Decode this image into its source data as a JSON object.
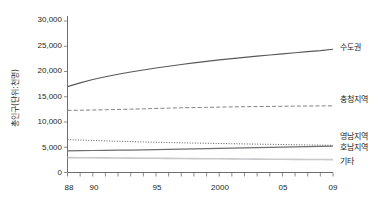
{
  "chart_data": {
    "type": "line",
    "title": "",
    "xlabel": "",
    "ylabel": "총인구(단위:천명)",
    "ylim": [
      0,
      30000
    ],
    "xlim": [
      1988,
      2009
    ],
    "grid": false,
    "legend_position": "right-inline",
    "y_ticks": [
      "0",
      "5,000",
      "10,000",
      "15,000",
      "20,000",
      "25,000",
      "30,000"
    ],
    "y_tick_values": [
      0,
      5000,
      10000,
      15000,
      20000,
      25000,
      30000
    ],
    "x_ticks": [
      "88",
      "90",
      "95",
      "2000",
      "05",
      "09"
    ],
    "x_tick_values": [
      1988,
      1990,
      1995,
      2000,
      2005,
      2009
    ],
    "x": [
      1988,
      1989,
      1990,
      1991,
      1992,
      1993,
      1994,
      1995,
      1996,
      1997,
      1998,
      1999,
      2000,
      2001,
      2002,
      2003,
      2004,
      2005,
      2006,
      2007,
      2008,
      2009
    ],
    "series": [
      {
        "name": "수도권",
        "style": "solid",
        "color": "#58595b",
        "values": [
          17000,
          17750,
          18400,
          18950,
          19450,
          19900,
          20300,
          20700,
          21050,
          21400,
          21700,
          22000,
          22300,
          22550,
          22800,
          23050,
          23280,
          23500,
          23720,
          23930,
          24130,
          24400
        ]
      },
      {
        "name": "충청지역",
        "style": "dashed",
        "color": "#808285",
        "values": [
          12300,
          12330,
          12370,
          12420,
          12480,
          12540,
          12600,
          12680,
          12750,
          12810,
          12860,
          12900,
          12950,
          12990,
          13030,
          13060,
          13090,
          13120,
          13140,
          13160,
          13180,
          13200
        ]
      },
      {
        "name": "영남지역",
        "style": "dotted",
        "color": "#58595b",
        "values": [
          6500,
          6420,
          6340,
          6260,
          6190,
          6120,
          6050,
          5990,
          5930,
          5880,
          5830,
          5790,
          5740,
          5700,
          5660,
          5620,
          5580,
          5540,
          5500,
          5460,
          5420,
          5380
        ]
      },
      {
        "name": "호남지역",
        "style": "solid",
        "color": "#6d6e70",
        "values": [
          4300,
          4330,
          4360,
          4390,
          4420,
          4450,
          4490,
          4530,
          4570,
          4610,
          4660,
          4710,
          4760,
          4810,
          4860,
          4910,
          4960,
          5010,
          5060,
          5110,
          5160,
          5220
        ]
      },
      {
        "name": "기타",
        "style": "solid",
        "color": "#c7c8ca",
        "values": [
          2950,
          2930,
          2910,
          2890,
          2870,
          2850,
          2830,
          2810,
          2790,
          2770,
          2750,
          2730,
          2710,
          2690,
          2670,
          2650,
          2630,
          2610,
          2600,
          2580,
          2560,
          2550
        ]
      }
    ]
  },
  "axis": {
    "y_title": "총인구(단위:천명)"
  },
  "labels": {
    "sudogwon": "수도권",
    "chungcheong": "충청지역",
    "yeongnam": "영남지역",
    "honam": "호남지역",
    "gita": "기타"
  },
  "y_axis_ticks": {
    "t0": "0",
    "t1": "5,000",
    "t2": "10,000",
    "t3": "15,000",
    "t4": "20,000",
    "t5": "25,000",
    "t6": "30,000"
  },
  "x_axis_ticks": {
    "t88": "88",
    "t90": "90",
    "t95": "95",
    "t2000": "2000",
    "t05": "05",
    "t09": "09"
  }
}
